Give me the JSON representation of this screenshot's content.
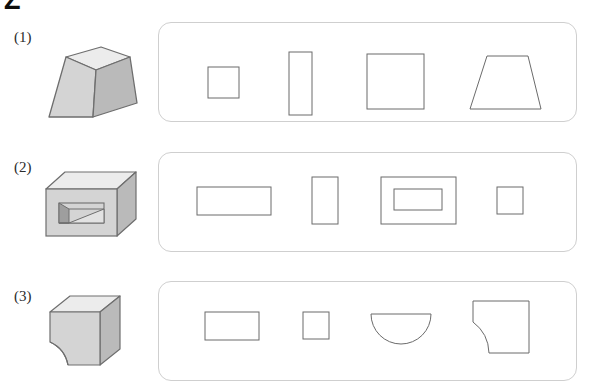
{
  "page": {
    "corner_glyph": "Z",
    "background_color": "#ffffff",
    "ink_color": "#231f20",
    "panel_border_color": "#cfcfcf",
    "shape_stroke_color": "#6b6b6b",
    "solid_fill_front": "#d4d4d4",
    "solid_fill_top": "#ececec",
    "solid_fill_side": "#bcbcbc",
    "solid_stroke_color": "#6e6e6e"
  },
  "rows": [
    {
      "label": "(1)",
      "solid": {
        "name": "truncated-pyramid-frustum",
        "description": "Square frustum (truncated pyramid) shown in oblique view"
      },
      "views": [
        {
          "name": "small-square",
          "label": "small square"
        },
        {
          "name": "tall-rectangle",
          "label": "tall vertical rectangle"
        },
        {
          "name": "large-square",
          "label": "large square"
        },
        {
          "name": "trapezoid",
          "label": "trapezoid"
        }
      ]
    },
    {
      "label": "(2)",
      "solid": {
        "name": "box-with-rectangular-slot",
        "description": "Rectangular box with a rectangular slot cut into the front face"
      },
      "views": [
        {
          "name": "wide-rectangle",
          "label": "wide rectangle"
        },
        {
          "name": "small-vertical-rectangle",
          "label": "small vertical rectangle"
        },
        {
          "name": "nested-rectangles",
          "label": "rectangle containing an inner rectangle"
        },
        {
          "name": "small-square",
          "label": "small square"
        }
      ]
    },
    {
      "label": "(3)",
      "solid": {
        "name": "cube-with-quarter-cylinder-cut",
        "description": "Cube with a quarter-cylinder notch removed from the lower front-left"
      },
      "views": [
        {
          "name": "wide-rectangle",
          "label": "wide rectangle"
        },
        {
          "name": "small-square",
          "label": "small square"
        },
        {
          "name": "semicircle",
          "label": "semicircle with flat top"
        },
        {
          "name": "square-with-quarter-circle-cut",
          "label": "square with quarter-circle cut from lower left"
        }
      ]
    }
  ]
}
